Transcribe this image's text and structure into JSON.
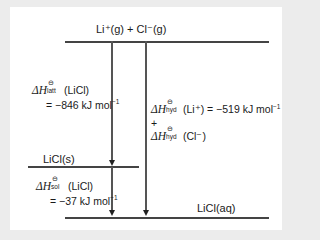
{
  "diagram": {
    "top_level": {
      "label": "Li⁺(g)  +  Cl⁻(g)"
    },
    "middle_level": {
      "label": "LiCl(s)"
    },
    "bottom_level": {
      "label": "LiCl(aq)"
    },
    "lattice": {
      "delta": "ΔH",
      "std": "⊖",
      "subscript": "latt",
      "species": " (LiCl)",
      "value": "= −846 kJ mol",
      "unit_exp": "−1"
    },
    "hydration": {
      "delta": "ΔH",
      "std": "⊖",
      "subscript": "hyd",
      "li_species": " (Li⁺)  = −519 kJ mol",
      "unit_exp": "−1",
      "plus": "+",
      "cl_species": " (Cl⁻)"
    },
    "solution": {
      "delta": "ΔH",
      "std": "⊖",
      "subscript": "sol",
      "species": " (LiCl)",
      "value": "= −37 kJ mol",
      "unit_exp": "−1"
    }
  }
}
